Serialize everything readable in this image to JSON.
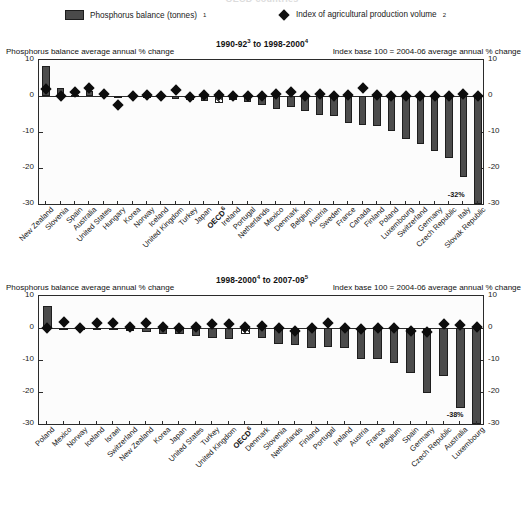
{
  "page": {
    "cropped_title": "OECD countries"
  },
  "legend": {
    "bar_label": "Phosphorus balance (tonnes)",
    "bar_superscript": "1",
    "bar_icon": "filled-rect-swatch",
    "diamond_label": "Index of agricultural production volume",
    "diamond_superscript": "2",
    "diamond_icon": "diamond-marker"
  },
  "axis_captions": {
    "left": "Phosphorus balance average annual % change",
    "right": "Index base 100 = 2004-06 average annual % change"
  },
  "panels": [
    {
      "id": "panel-1",
      "title": "1990-92",
      "title_sup1": "3",
      "title_mid": " to 1998-2000",
      "title_sup2": "4",
      "full_title": "1990-92³ to 1998-2000⁴",
      "annotation": "-32%"
    },
    {
      "id": "panel-2",
      "title": "1998-2000",
      "title_sup1": "4",
      "title_mid": " to 2007-09",
      "title_sup2": "5",
      "full_title": "1998-2000⁴ to 2007-09⁵",
      "annotation": "-38%"
    }
  ],
  "chart_data": [
    {
      "type": "bar",
      "title": "1990-92 to 1998-2000",
      "xlabel": "",
      "ylabel": "Phosphorus balance average annual % change",
      "ylabel_right": "Index base 100 = 2004-06 average annual % change",
      "ylim": [
        -30,
        10
      ],
      "yticks": [
        10,
        0,
        -10,
        -20,
        -30
      ],
      "grid": false,
      "legend_position": "top",
      "categories": [
        "New Zealand",
        "Slovenia",
        "Spain",
        "Australia",
        "United States",
        "Hungary",
        "Korea",
        "Norway",
        "Iceland",
        "United Kingdom",
        "Turkey",
        "Japan",
        "OECD",
        "Ireland",
        "Portugal",
        "Netherlands",
        "Mexico",
        "Denmark",
        "Belgium",
        "Austria",
        "Sweden",
        "France",
        "Canada",
        "Finland",
        "Poland",
        "Luxembourg",
        "Switzerland",
        "Germany",
        "Czech Republic",
        "Italy",
        "Slovak Republic"
      ],
      "series": [
        {
          "name": "Phosphorus balance (tonnes)",
          "type": "bar",
          "values": [
            8.2,
            2.1,
            0.4,
            1.5,
            0.3,
            -0.2,
            -0.4,
            -0.5,
            -0.6,
            -0.8,
            -1.0,
            -1.4,
            -2.0,
            -1.2,
            -1.6,
            -2.4,
            -3.6,
            -3.1,
            -4.1,
            -5.2,
            -5.6,
            -7.6,
            -8.0,
            -8.4,
            -9.8,
            -12.0,
            -13.4,
            -15.4,
            -17.2,
            -22.5,
            -32.0
          ]
        },
        {
          "name": "Index of agricultural production volume",
          "type": "scatter",
          "values": [
            1.9,
            0.1,
            1.1,
            2.1,
            0.6,
            -2.6,
            0.0,
            0.2,
            -0.1,
            1.7,
            -0.2,
            0.4,
            0.3,
            0.0,
            -0.1,
            0.1,
            0.5,
            1.2,
            0.1,
            0.6,
            0.1,
            0.2,
            2.2,
            0.2,
            0.1,
            0.1,
            -0.1,
            0.0,
            0.1,
            0.6,
            0.0
          ]
        }
      ],
      "annotations": [
        {
          "text": "-32%",
          "category": "Slovak Republic"
        }
      ],
      "oecd_category": "OECD"
    },
    {
      "type": "bar",
      "title": "1998-2000 to 2007-09",
      "xlabel": "",
      "ylabel": "Phosphorus balance average annual % change",
      "ylabel_right": "Index base 100 = 2004-06 average annual % change",
      "ylim": [
        -30,
        10
      ],
      "yticks": [
        10,
        0,
        -10,
        -20,
        -30
      ],
      "grid": false,
      "legend_position": "top",
      "categories": [
        "Poland",
        "Mexico",
        "Norway",
        "Iceland",
        "Israel",
        "Switzerland",
        "New Zealand",
        "Korea",
        "Japan",
        "United States",
        "Turkey",
        "United Kingdom",
        "OECD",
        "Denmark",
        "Slovenia",
        "Netherlands",
        "Finland",
        "Portugal",
        "Ireland",
        "Austria",
        "France",
        "Belgium",
        "Spain",
        "Germany",
        "Czech Republic",
        "Australia",
        "Luxembourg"
      ],
      "series": [
        {
          "name": "Phosphorus balance (tonnes)",
          "type": "bar",
          "values": [
            7.0,
            0.1,
            -0.2,
            -0.4,
            -0.3,
            -1.0,
            -1.4,
            -1.8,
            -2.0,
            -2.4,
            -3.0,
            -3.4,
            -2.0,
            -3.0,
            -5.1,
            -5.2,
            -6.2,
            -6.0,
            -6.1,
            -9.6,
            -9.8,
            -11.0,
            -14.0,
            -20.2,
            -15.0,
            -25.0,
            -38.0
          ]
        },
        {
          "name": "Index of agricultural production volume",
          "type": "scatter",
          "values": [
            0.1,
            1.8,
            0.0,
            1.5,
            1.5,
            0.2,
            1.6,
            0.4,
            0.1,
            0.2,
            1.1,
            1.4,
            0.4,
            0.5,
            0.1,
            -1.0,
            0.0,
            1.6,
            0.1,
            -0.3,
            0.1,
            0.0,
            -1.0,
            -1.2,
            1.3,
            0.9,
            0.2
          ]
        }
      ],
      "annotations": [
        {
          "text": "-38%",
          "category": "Luxembourg"
        }
      ],
      "oecd_category": "OECD"
    }
  ]
}
